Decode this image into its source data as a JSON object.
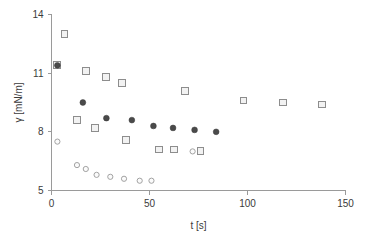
{
  "chart_data": {
    "type": "scatter",
    "title": "",
    "xlabel": "t [s]",
    "ylabel": "γ [mN/m]",
    "xlim": [
      0,
      150
    ],
    "ylim": [
      5,
      14
    ],
    "xticks": [
      0,
      50,
      100,
      150
    ],
    "yticks": [
      5,
      8,
      11,
      14
    ],
    "xtick_labels": [
      "0",
      "50",
      "100",
      "150"
    ],
    "ytick_labels": [
      "5",
      "8",
      "11",
      "14"
    ],
    "grid": false,
    "legend": "none",
    "series": [
      {
        "name": "open-squares",
        "marker": "open-square",
        "color": "#8d8d8d",
        "points": [
          {
            "x": 3.0,
            "y": 11.4
          },
          {
            "x": 6.6,
            "y": 13.0
          },
          {
            "x": 13.0,
            "y": 8.6
          },
          {
            "x": 17.5,
            "y": 11.1
          },
          {
            "x": 22.0,
            "y": 8.2
          },
          {
            "x": 28.0,
            "y": 10.8
          },
          {
            "x": 36.0,
            "y": 10.5
          },
          {
            "x": 38.0,
            "y": 7.6
          },
          {
            "x": 55.0,
            "y": 7.1
          },
          {
            "x": 62.5,
            "y": 7.1
          },
          {
            "x": 68.0,
            "y": 10.1
          },
          {
            "x": 76.0,
            "y": 7.0
          },
          {
            "x": 98.0,
            "y": 9.6
          },
          {
            "x": 118.0,
            "y": 9.5
          },
          {
            "x": 138.0,
            "y": 9.4
          }
        ]
      },
      {
        "name": "filled-circles",
        "marker": "filled-circle",
        "color": "#4a4a4a",
        "points": [
          {
            "x": 3.0,
            "y": 11.4
          },
          {
            "x": 16.0,
            "y": 9.5
          },
          {
            "x": 28.0,
            "y": 8.7
          },
          {
            "x": 41.0,
            "y": 8.6
          },
          {
            "x": 52.0,
            "y": 8.3
          },
          {
            "x": 62.0,
            "y": 8.2
          },
          {
            "x": 73.0,
            "y": 8.1
          },
          {
            "x": 84.0,
            "y": 8.0
          }
        ]
      },
      {
        "name": "open-circles",
        "marker": "open-circle",
        "color": "#a2a2a2",
        "points": [
          {
            "x": 3.0,
            "y": 7.5
          },
          {
            "x": 13.0,
            "y": 6.3
          },
          {
            "x": 17.5,
            "y": 6.1
          },
          {
            "x": 23.0,
            "y": 5.8
          },
          {
            "x": 30.0,
            "y": 5.7
          },
          {
            "x": 37.0,
            "y": 5.6
          },
          {
            "x": 45.0,
            "y": 5.5
          },
          {
            "x": 51.0,
            "y": 5.5
          },
          {
            "x": 72.0,
            "y": 7.0
          }
        ]
      }
    ]
  }
}
